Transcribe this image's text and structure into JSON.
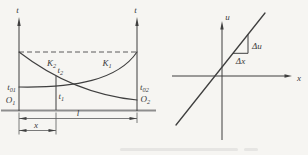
{
  "theme": {
    "background_color": "#f6f5f2",
    "ink_color": "#3f3f3f",
    "baseline_color": "#8e8e8e"
  },
  "figure": {
    "left": {
      "axis_left_label": "t",
      "axis_right_label": "t",
      "curve_k2": {
        "base": "K",
        "sub": "2"
      },
      "curve_k1": {
        "base": "K",
        "sub": "1"
      },
      "label_t2": {
        "base": "t",
        "sub": "2"
      },
      "label_t1": {
        "base": "t",
        "sub": "1"
      },
      "label_t01": {
        "base": "t",
        "sub": "01"
      },
      "label_t02": {
        "base": "t",
        "sub": "02"
      },
      "label_o1": {
        "base": "O",
        "sub": "1"
      },
      "label_o2": {
        "base": "O",
        "sub": "2"
      },
      "dim_total_label": "l",
      "dim_x_label": "x"
    },
    "right": {
      "axis_u_label": "u",
      "axis_x_label": "x",
      "delta_u_label": "Δu",
      "delta_x_label": "Δx"
    }
  }
}
